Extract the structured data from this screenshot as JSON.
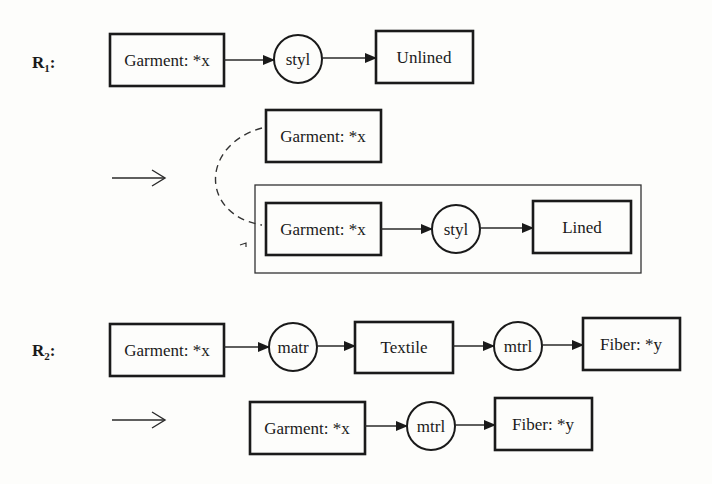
{
  "rules": [
    {
      "label": "R",
      "subscript": "1",
      "suffix": ":",
      "lhs": {
        "nodes": [
          {
            "type": "concept",
            "text": "Garment: *x"
          },
          {
            "type": "relation",
            "text": "styl"
          },
          {
            "type": "concept",
            "text": "Unlined"
          }
        ]
      },
      "implies_symbol": "→",
      "rhs": {
        "detached_concept": {
          "type": "concept",
          "text": "Garment: *x"
        },
        "context_nodes": [
          {
            "type": "concept",
            "text": "Garment: *x"
          },
          {
            "type": "relation",
            "text": "styl"
          },
          {
            "type": "concept",
            "text": "Lined"
          }
        ],
        "coreference_link": "dashed"
      }
    },
    {
      "label": "R",
      "subscript": "2",
      "suffix": ":",
      "lhs": {
        "nodes": [
          {
            "type": "concept",
            "text": "Garment: *x"
          },
          {
            "type": "relation",
            "text": "matr"
          },
          {
            "type": "concept",
            "text": "Textile"
          },
          {
            "type": "relation",
            "text": "mtrl"
          },
          {
            "type": "concept",
            "text": "Fiber: *y"
          }
        ]
      },
      "implies_symbol": "→",
      "rhs": {
        "nodes": [
          {
            "type": "concept",
            "text": "Garment: *x"
          },
          {
            "type": "relation",
            "text": "mtrl"
          },
          {
            "type": "concept",
            "text": "Fiber: *y"
          }
        ]
      }
    }
  ]
}
